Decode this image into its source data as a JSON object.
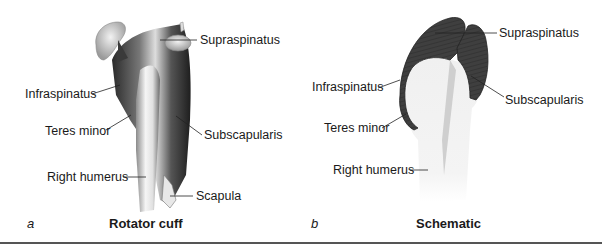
{
  "figure": {
    "panels": [
      {
        "letter": "a",
        "title": "Rotator cuff",
        "labels": {
          "supraspinatus": "Supraspinatus",
          "infraspinatus": "Infraspinatus",
          "teres_minor": "Teres minor",
          "subscapularis": "Subscapularis",
          "right_humerus": "Right humerus",
          "scapula": "Scapula"
        }
      },
      {
        "letter": "b",
        "title": "Schematic",
        "labels": {
          "supraspinatus": "Supraspinatus",
          "infraspinatus": "Infraspinatus",
          "teres_minor": "Teres minor",
          "subscapularis": "Subscapularis",
          "right_humerus": "Right humerus"
        }
      }
    ],
    "colors": {
      "muscle_dark": "#3a3a3a",
      "bone_light": "#ececec",
      "rule": "#555555",
      "text": "#1a1a1a"
    }
  }
}
